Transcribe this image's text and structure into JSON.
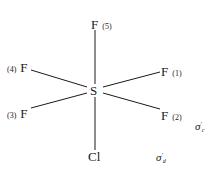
{
  "diagram": {
    "title": "",
    "center_atom": "S",
    "ligands": [
      {
        "id": "f5",
        "element": "F",
        "index_label": "(5)",
        "position": "axial-top"
      },
      {
        "id": "f1",
        "element": "F",
        "index_label": "(1)",
        "position": "equatorial-upper-right"
      },
      {
        "id": "f2",
        "element": "F",
        "index_label": "(2)",
        "position": "equatorial-lower-right"
      },
      {
        "id": "f3",
        "element": "F",
        "index_label": "(3)",
        "position": "equatorial-lower-left"
      },
      {
        "id": "f4",
        "element": "F",
        "index_label": "(4)",
        "position": "equatorial-upper-left"
      },
      {
        "id": "cl",
        "element": "Cl",
        "index_label": "",
        "position": "axial-bottom"
      }
    ],
    "symmetry_labels": {
      "sigma_c": {
        "symbol": "σ",
        "prime": "′",
        "subscript": "c"
      },
      "sigma_d": {
        "symbol": "σ",
        "prime": "′",
        "subscript": "d"
      }
    },
    "line_color": "#1a1a1a"
  }
}
